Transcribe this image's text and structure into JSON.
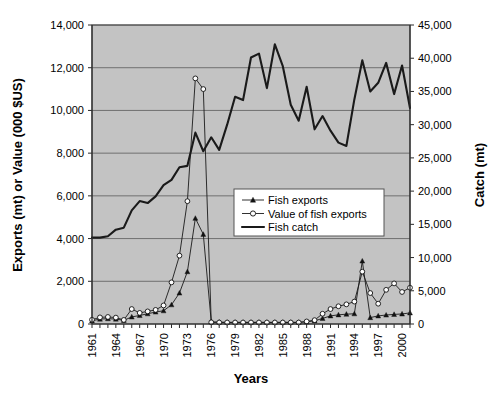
{
  "chart_data": {
    "type": "line",
    "title": "",
    "xlabel": "Years",
    "ylabel": "Exports (mt) or Value (000 $US)",
    "y2label": "Catch (mt)",
    "ylim": [
      0,
      14000
    ],
    "y2lim": [
      0,
      45000
    ],
    "xlim": [
      1961,
      2001
    ],
    "grid": true,
    "legend_position": "center-right",
    "y_ticks": [
      "0",
      "2,000",
      "4,000",
      "6,000",
      "8,000",
      "10,000",
      "12,000",
      "14,000"
    ],
    "y_tick_values": [
      0,
      2000,
      4000,
      6000,
      8000,
      10000,
      12000,
      14000
    ],
    "y2_ticks": [
      "0",
      "5,000",
      "10,000",
      "15,000",
      "20,000",
      "25,000",
      "30,000",
      "35,000",
      "40,000",
      "45,000"
    ],
    "y2_tick_values": [
      0,
      5000,
      10000,
      15000,
      20000,
      25000,
      30000,
      35000,
      40000,
      45000
    ],
    "x_ticks": [
      "1961",
      "1964",
      "1967",
      "1970",
      "1973",
      "1976",
      "1979",
      "1982",
      "1985",
      "1988",
      "1991",
      "1994",
      "1997",
      "2000"
    ],
    "x_tick_values": [
      1961,
      1964,
      1967,
      1970,
      1973,
      1976,
      1979,
      1982,
      1985,
      1988,
      1991,
      1994,
      1997,
      2000
    ],
    "x": [
      1961,
      1962,
      1963,
      1964,
      1965,
      1966,
      1967,
      1968,
      1969,
      1970,
      1971,
      1972,
      1973,
      1974,
      1975,
      1976,
      1977,
      1978,
      1979,
      1980,
      1981,
      1982,
      1983,
      1984,
      1985,
      1986,
      1987,
      1988,
      1989,
      1990,
      1991,
      1992,
      1993,
      1994,
      1995,
      1996,
      1997,
      1998,
      1999,
      2000,
      2001
    ],
    "series": [
      {
        "name": "Fish exports",
        "axis": "left",
        "marker": "filled-triangle",
        "line_width": "thin",
        "values": [
          150,
          230,
          250,
          230,
          170,
          330,
          400,
          480,
          560,
          620,
          900,
          1450,
          2450,
          4950,
          4200,
          100,
          90,
          80,
          80,
          80,
          80,
          80,
          80,
          80,
          80,
          80,
          80,
          100,
          150,
          260,
          380,
          430,
          460,
          480,
          2950,
          300,
          380,
          420,
          450,
          470,
          520
        ]
      },
      {
        "name": "Value of fish exports",
        "axis": "left",
        "marker": "open-circle",
        "line_width": "thin",
        "values": [
          200,
          310,
          330,
          300,
          190,
          700,
          520,
          590,
          660,
          870,
          1950,
          3200,
          5750,
          11500,
          11000,
          80,
          70,
          70,
          70,
          70,
          70,
          70,
          70,
          70,
          70,
          70,
          70,
          120,
          180,
          480,
          700,
          830,
          920,
          1050,
          2450,
          1450,
          950,
          1600,
          1900,
          1500,
          1700
        ]
      },
      {
        "name": "Fish catch",
        "axis": "right",
        "marker": "none",
        "line_width": "thick",
        "values": [
          13000,
          13000,
          13200,
          14200,
          14500,
          17100,
          18500,
          18200,
          19200,
          20900,
          21700,
          23600,
          23800,
          28800,
          26000,
          28100,
          26200,
          30000,
          34200,
          33700,
          40100,
          40700,
          35500,
          42100,
          38800,
          33000,
          30600,
          35700,
          29300,
          31300,
          29100,
          27300,
          26800,
          33800,
          39700,
          35000,
          36300,
          39300,
          34600,
          38900,
          32500
        ]
      }
    ],
    "legend": [
      {
        "label": "Fish exports",
        "marker": "filled-triangle",
        "line": "thin"
      },
      {
        "label": "Value of fish exports",
        "marker": "open-circle",
        "line": "thin"
      },
      {
        "label": "Fish catch",
        "marker": "none",
        "line": "thick"
      }
    ],
    "colors": {
      "plot_background": "#c3c3c3",
      "line": "#1a1a1a",
      "grid": "#5a5a5a",
      "figure_background": "#ffffff"
    }
  }
}
